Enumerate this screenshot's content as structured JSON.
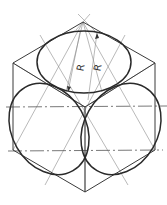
{
  "figure": {
    "title": "",
    "labels": {
      "radius_1": "R",
      "radius_2": "R"
    },
    "colors": {
      "line": "#2a2a2a",
      "construction": "#8a8a8a",
      "background": "#ffffff"
    }
  }
}
